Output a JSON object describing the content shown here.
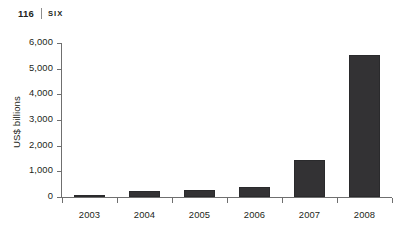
{
  "runhead": {
    "page_number": "116",
    "section": "SIX"
  },
  "chart_data": {
    "type": "bar",
    "title": "",
    "xlabel": "",
    "ylabel": "US$ billions",
    "categories": [
      "2003",
      "2004",
      "2005",
      "2006",
      "2007",
      "2008"
    ],
    "values": [
      60,
      230,
      270,
      380,
      1440,
      5550
    ],
    "ylim": [
      0,
      6000
    ],
    "ytick_values": [
      0,
      1000,
      2000,
      3000,
      4000,
      5000,
      6000
    ],
    "ytick_labels": [
      "0",
      "1,000",
      "2,000",
      "3,000",
      "4,000",
      "5,000",
      "6,000"
    ],
    "grid": false,
    "legend": false,
    "bar_color": "#333234",
    "axis_color": "#6f6f6f",
    "text_color": "#231f20"
  }
}
